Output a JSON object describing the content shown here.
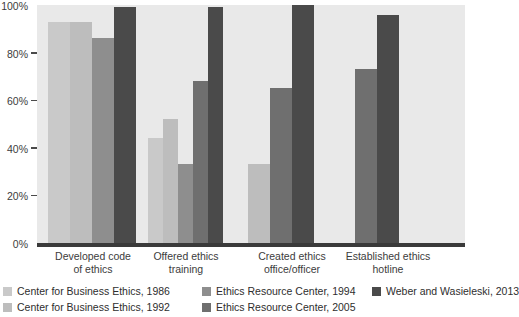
{
  "chart_data": {
    "type": "bar",
    "title": "",
    "xlabel": "",
    "ylabel": "",
    "ylim": [
      0,
      100
    ],
    "grid": false,
    "legend_position": "bottom",
    "y_ticks": [
      "0%",
      "20%",
      "40%",
      "60%",
      "80%",
      "100%"
    ],
    "y_tick_values": [
      0,
      20,
      40,
      60,
      80,
      100
    ],
    "categories": [
      "Developed code\nof ethics",
      "Offered ethics\ntraining",
      "Created ethics\noffice/officer",
      "Established ethics\nhotline"
    ],
    "series": [
      {
        "name": "Center for Business Ethics, 1986",
        "color": "#c9c9c9",
        "values": [
          93,
          44,
          null,
          null
        ]
      },
      {
        "name": "Center for Business Ethics, 1992",
        "color": "#bdbdbd",
        "values": [
          93,
          52,
          33,
          null
        ]
      },
      {
        "name": "Ethics Resource Center, 1994",
        "color": "#8e8e8e",
        "values": [
          86,
          33,
          null,
          null
        ]
      },
      {
        "name": "Ethics Resource Center, 2005",
        "color": "#6f6f6f",
        "values": [
          null,
          68,
          65,
          73
        ]
      },
      {
        "name": "Weber and  Wasieleski, 2013",
        "color": "#4a4a4a",
        "values": [
          99,
          99,
          100,
          96
        ]
      }
    ]
  },
  "axis": {
    "y_labels": [
      "100%",
      "80%",
      "60%",
      "40%",
      "20%",
      "0%"
    ]
  },
  "categories": {
    "c0": "Developed code\nof ethics",
    "c1": "Offered ethics\ntraining",
    "c2": "Created ethics\noffice/officer",
    "c3": "Established ethics\nhotline"
  },
  "legend": {
    "row1": [
      {
        "label": "Center for Business Ethics, 1986",
        "color": "#c9c9c9"
      },
      {
        "label": "Ethics Resource Center, 1994",
        "color": "#8e8e8e"
      },
      {
        "label": "Weber and  Wasieleski, 2013",
        "color": "#4a4a4a"
      }
    ],
    "row2": [
      {
        "label": "Center for Business Ethics, 1992",
        "color": "#bdbdbd"
      },
      {
        "label": "Ethics Resource Center, 2005",
        "color": "#6f6f6f"
      }
    ]
  }
}
